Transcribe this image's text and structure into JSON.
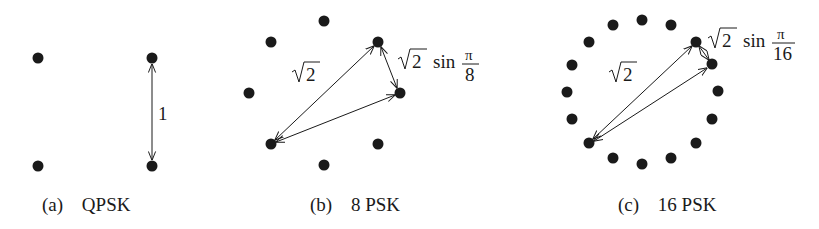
{
  "panels": [
    {
      "id": "a",
      "caption_letter": "a",
      "caption_title": "QPSK",
      "distance_label": "1"
    },
    {
      "id": "b",
      "caption_letter": "b",
      "caption_title": "8 PSK",
      "long_label": "2",
      "short_label_coef": "2",
      "short_label_fn": "sin",
      "short_label_num": "π",
      "short_label_den": "8"
    },
    {
      "id": "c",
      "caption_letter": "c",
      "caption_title": "16 PSK",
      "long_label": "2",
      "short_label_coef": "2",
      "short_label_fn": "sin",
      "short_label_num": "π",
      "short_label_den": "16"
    }
  ],
  "colors": {
    "ink": "#1a1a1a",
    "background": "#ffffff"
  }
}
